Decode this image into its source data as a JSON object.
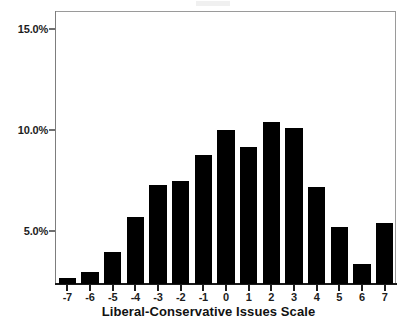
{
  "chart_data": {
    "type": "bar",
    "title": "",
    "subtitle": "",
    "xlabel": "Liberal-Conservative Issues Scale",
    "ylabel": "",
    "categories": [
      "-7",
      "-6",
      "-5",
      "-4",
      "-3",
      "-2",
      "-1",
      "0",
      "1",
      "2",
      "3",
      "4",
      "5",
      "6",
      "7"
    ],
    "values": [
      2.7,
      3.0,
      4.0,
      5.7,
      7.3,
      7.5,
      8.8,
      10.0,
      9.2,
      10.4,
      10.1,
      7.2,
      5.2,
      3.4,
      5.4
    ],
    "value_unit": "%",
    "ylim": [
      2.4,
      15.9
    ],
    "ytick_labels": [
      "15.0%",
      "10.0%",
      "5.0%"
    ],
    "ytick_values": [
      15.0,
      10.0,
      5.0
    ],
    "grid": false,
    "legend": null,
    "legend_position": "none",
    "bar_color": "#000000",
    "frame_color": "#8a8a8a",
    "axis_text_color": "#1d1d1d",
    "background_color": "#ffffff"
  },
  "axes": {
    "x_title": "Liberal-Conservative Issues Scale"
  }
}
